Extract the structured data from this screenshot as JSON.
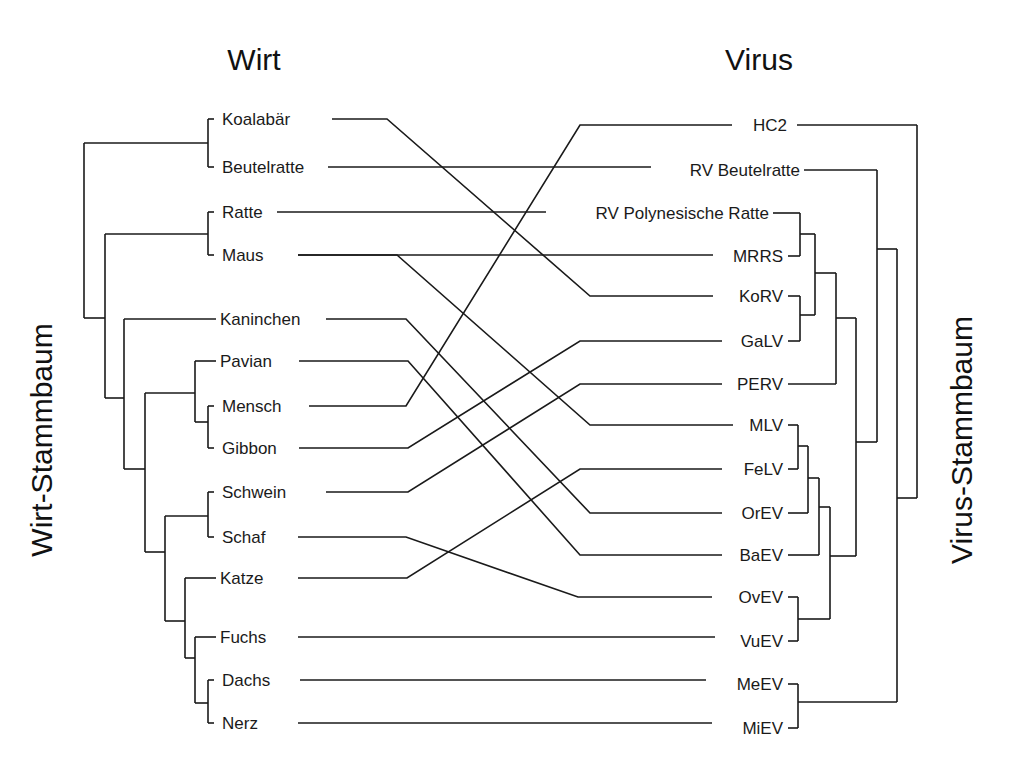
{
  "titles": {
    "host": "Wirt",
    "virus": "Virus",
    "host_tree": "Wirt-Stammbaum",
    "virus_tree": "Virus-Stammbaum"
  },
  "hosts": [
    {
      "id": "koalabaer",
      "label": "Koalabär",
      "y": 119,
      "textX": 222,
      "lineStart": 332
    },
    {
      "id": "beutelratte",
      "label": "Beutelratte",
      "y": 167,
      "textX": 222,
      "lineStart": 328
    },
    {
      "id": "ratte",
      "label": "Ratte",
      "y": 212,
      "textX": 222,
      "lineStart": 277
    },
    {
      "id": "maus",
      "label": "Maus",
      "y": 255,
      "textX": 222,
      "lineStart": 298
    },
    {
      "id": "kaninchen",
      "label": "Kaninchen",
      "y": 319,
      "textX": 220,
      "lineStart": 326
    },
    {
      "id": "pavian",
      "label": "Pavian",
      "y": 361,
      "textX": 220,
      "lineStart": 299
    },
    {
      "id": "mensch",
      "label": "Mensch",
      "y": 406,
      "textX": 222,
      "lineStart": 309
    },
    {
      "id": "gibbon",
      "label": "Gibbon",
      "y": 448,
      "textX": 222,
      "lineStart": 299
    },
    {
      "id": "schwein",
      "label": "Schwein",
      "y": 492,
      "textX": 222,
      "lineStart": 326
    },
    {
      "id": "schaf",
      "label": "Schaf",
      "y": 537,
      "textX": 222,
      "lineStart": 298
    },
    {
      "id": "katze",
      "label": "Katze",
      "y": 578,
      "textX": 220,
      "lineStart": 298
    },
    {
      "id": "fuchs",
      "label": "Fuchs",
      "y": 637,
      "textX": 220,
      "lineStart": 298
    },
    {
      "id": "dachs",
      "label": "Dachs",
      "y": 680,
      "textX": 222,
      "lineStart": 300
    },
    {
      "id": "nerz",
      "label": "Nerz",
      "y": 723,
      "textX": 222,
      "lineStart": 298
    }
  ],
  "viruses": [
    {
      "id": "hc2",
      "label": "HC2",
      "y": 125,
      "textRight": 787,
      "lineEnd": 732
    },
    {
      "id": "rvbeutel",
      "label": "RV Beutelratte",
      "y": 170,
      "textRight": 800,
      "lineEnd": 651
    },
    {
      "id": "rvpoly",
      "label": "RV Polynesische Ratte",
      "y": 213,
      "textRight": 769,
      "lineEnd": 546
    },
    {
      "id": "mrrs",
      "label": "MRRS",
      "y": 256,
      "textRight": 783,
      "lineEnd": 713
    },
    {
      "id": "korv",
      "label": "KoRV",
      "y": 296,
      "textRight": 783,
      "lineEnd": 713
    },
    {
      "id": "galv",
      "label": "GaLV",
      "y": 341,
      "textRight": 783,
      "lineEnd": 722
    },
    {
      "id": "perv",
      "label": "PERV",
      "y": 384,
      "textRight": 783,
      "lineEnd": 722
    },
    {
      "id": "mlv",
      "label": "MLV",
      "y": 425,
      "textRight": 783,
      "lineEnd": 733
    },
    {
      "id": "felv",
      "label": "FeLV",
      "y": 469,
      "textRight": 783,
      "lineEnd": 722
    },
    {
      "id": "orev",
      "label": "OrEV",
      "y": 513,
      "textRight": 783,
      "lineEnd": 722
    },
    {
      "id": "baev",
      "label": "BaEV",
      "y": 555,
      "textRight": 783,
      "lineEnd": 722
    },
    {
      "id": "ovev",
      "label": "OvEV",
      "y": 597,
      "textRight": 783,
      "lineEnd": 712
    },
    {
      "id": "vuev",
      "label": "VuEV",
      "y": 641,
      "textRight": 783,
      "lineEnd": 715
    },
    {
      "id": "meev",
      "label": "MeEV",
      "y": 684,
      "textRight": 783,
      "lineEnd": 706
    },
    {
      "id": "miev",
      "label": "MiEV",
      "y": 728,
      "textRight": 783,
      "lineEnd": 712
    }
  ],
  "links": [
    {
      "host": "koalabaer",
      "virus": "korv",
      "bendHost": 387,
      "bendVirus": 590
    },
    {
      "host": "beutelratte",
      "virus": "rvbeutel",
      "bendHost": null,
      "bendVirus": null
    },
    {
      "host": "ratte",
      "virus": "rvpoly",
      "bendHost": null,
      "bendVirus": null
    },
    {
      "host": "maus",
      "virus": "mrrs",
      "bendHost": null,
      "bendVirus": null
    },
    {
      "host": "maus",
      "virus": "mlv",
      "bendHost": 397,
      "bendVirus": 590
    },
    {
      "host": "kaninchen",
      "virus": "orev",
      "bendHost": 406,
      "bendVirus": 590
    },
    {
      "host": "pavian",
      "virus": "baev",
      "bendHost": 408,
      "bendVirus": 580
    },
    {
      "host": "mensch",
      "virus": "hc2",
      "bendHost": 406,
      "bendVirus": 580
    },
    {
      "host": "gibbon",
      "virus": "galv",
      "bendHost": 408,
      "bendVirus": 580
    },
    {
      "host": "schwein",
      "virus": "perv",
      "bendHost": 408,
      "bendVirus": 580
    },
    {
      "host": "schaf",
      "virus": "ovev",
      "bendHost": 406,
      "bendVirus": 578
    },
    {
      "host": "katze",
      "virus": "felv",
      "bendHost": 407,
      "bendVirus": 580
    },
    {
      "host": "fuchs",
      "virus": "vuev",
      "bendHost": null,
      "bendVirus": null
    },
    {
      "host": "dachs",
      "virus": "meev",
      "bendHost": null,
      "bendVirus": null
    },
    {
      "host": "nerz",
      "virus": "miev",
      "bendHost": null,
      "bendVirus": null
    }
  ],
  "host_tree_edges": [
    [
      208,
      119,
      208,
      167
    ],
    [
      208,
      119,
      214,
      119
    ],
    [
      208,
      167,
      214,
      167
    ],
    [
      208,
      212,
      208,
      255
    ],
    [
      208,
      212,
      214,
      212
    ],
    [
      208,
      255,
      214,
      255
    ],
    [
      208,
      143,
      84,
      143
    ],
    [
      84,
      143,
      84,
      318
    ],
    [
      208,
      234,
      105,
      234
    ],
    [
      105,
      234,
      105,
      398
    ],
    [
      84,
      318,
      105,
      318
    ],
    [
      124,
      319,
      216,
      319
    ],
    [
      124,
      319,
      124,
      469
    ],
    [
      105,
      398,
      124,
      398
    ],
    [
      195,
      361,
      195,
      422
    ],
    [
      195,
      361,
      216,
      361
    ],
    [
      208,
      406,
      208,
      448
    ],
    [
      208,
      406,
      214,
      406
    ],
    [
      208,
      448,
      214,
      448
    ],
    [
      195,
      422,
      208,
      422
    ],
    [
      195,
      393,
      145,
      393
    ],
    [
      145,
      393,
      145,
      552
    ],
    [
      124,
      469,
      145,
      469
    ],
    [
      208,
      492,
      208,
      537
    ],
    [
      208,
      492,
      214,
      492
    ],
    [
      208,
      537,
      214,
      537
    ],
    [
      208,
      516,
      165,
      516
    ],
    [
      165,
      516,
      165,
      621
    ],
    [
      145,
      552,
      165,
      552
    ],
    [
      185,
      578,
      216,
      578
    ],
    [
      185,
      578,
      185,
      658
    ],
    [
      165,
      621,
      185,
      621
    ],
    [
      195,
      637,
      216,
      637
    ],
    [
      195,
      637,
      195,
      703
    ],
    [
      185,
      658,
      195,
      658
    ],
    [
      208,
      680,
      208,
      723
    ],
    [
      208,
      680,
      214,
      680
    ],
    [
      208,
      723,
      214,
      723
    ],
    [
      195,
      703,
      208,
      703
    ]
  ],
  "virus_tree_edges": [
    [
      797,
      125,
      917,
      125
    ],
    [
      917,
      125,
      917,
      498
    ],
    [
      804,
      170,
      877,
      170
    ],
    [
      877,
      170,
      877,
      442
    ],
    [
      773,
      213,
      800,
      213
    ],
    [
      800,
      213,
      800,
      256
    ],
    [
      788,
      256,
      800,
      256
    ],
    [
      800,
      234,
      815,
      234
    ],
    [
      815,
      234,
      815,
      315
    ],
    [
      788,
      296,
      800,
      296
    ],
    [
      800,
      296,
      800,
      341
    ],
    [
      788,
      341,
      800,
      341
    ],
    [
      800,
      315,
      815,
      315
    ],
    [
      815,
      273,
      836,
      273
    ],
    [
      836,
      273,
      836,
      384
    ],
    [
      788,
      384,
      836,
      384
    ],
    [
      836,
      318,
      856,
      318
    ],
    [
      856,
      318,
      856,
      556
    ],
    [
      788,
      425,
      798,
      425
    ],
    [
      798,
      425,
      798,
      469
    ],
    [
      788,
      469,
      798,
      469
    ],
    [
      798,
      446,
      808,
      446
    ],
    [
      808,
      446,
      808,
      513
    ],
    [
      788,
      513,
      808,
      513
    ],
    [
      808,
      478,
      819,
      478
    ],
    [
      819,
      478,
      819,
      555
    ],
    [
      788,
      555,
      819,
      555
    ],
    [
      819,
      507,
      830,
      507
    ],
    [
      830,
      507,
      830,
      619
    ],
    [
      788,
      597,
      798,
      597
    ],
    [
      798,
      597,
      798,
      641
    ],
    [
      788,
      641,
      798,
      641
    ],
    [
      798,
      619,
      830,
      619
    ],
    [
      830,
      556,
      856,
      556
    ],
    [
      856,
      442,
      877,
      442
    ],
    [
      877,
      249,
      897,
      249
    ],
    [
      897,
      249,
      897,
      702
    ],
    [
      788,
      684,
      798,
      684
    ],
    [
      798,
      684,
      798,
      728
    ],
    [
      788,
      728,
      798,
      728
    ],
    [
      798,
      702,
      897,
      702
    ],
    [
      897,
      498,
      917,
      498
    ]
  ]
}
